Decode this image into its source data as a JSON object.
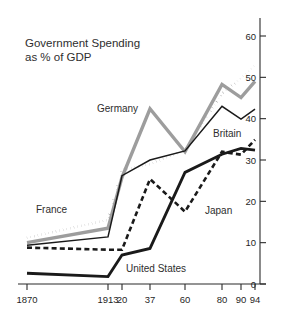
{
  "chart_data": {
    "type": "line",
    "title": "Government Spending\nas % of GDP",
    "title_line1": "Government Spending",
    "title_line2": "as % of GDP",
    "xlabel": "",
    "ylabel": "",
    "x": [
      1870,
      1913,
      1920,
      1937,
      1960,
      1980,
      1990,
      1994
    ],
    "xtick_labels": [
      "1870",
      "1913",
      "20",
      "37",
      "60",
      "80",
      "90",
      "94"
    ],
    "ytick_labels": [
      "0",
      "10",
      "20",
      "30",
      "40",
      "50",
      "60"
    ],
    "yticks": [
      0,
      10,
      20,
      30,
      40,
      50,
      60
    ],
    "ylim": [
      0,
      63
    ],
    "grid": false,
    "legend_position": "inline-annotations",
    "series": [
      {
        "name": "France",
        "values": [
          11.2,
          15.5,
          27.6,
          29.0,
          32.4,
          46.1,
          49.8,
          52.9
        ],
        "color": "#1a1a1a",
        "style": "dotted",
        "width": 2.6,
        "label_x": 36,
        "label_y": 213
      },
      {
        "name": "Germany",
        "values": [
          10.0,
          13.5,
          25.8,
          42.4,
          32.0,
          48.3,
          45.1,
          49.0
        ],
        "color": "#9d9d9d",
        "style": "solid",
        "width": 3.4,
        "label_x": 97,
        "label_y": 112
      },
      {
        "name": "Britain",
        "values": [
          9.4,
          11.4,
          26.2,
          30.0,
          32.2,
          43.0,
          39.9,
          42.3
        ],
        "color": "#1a1a1a",
        "style": "solid",
        "width": 1.5,
        "label_x": 213,
        "label_y": 137
      },
      {
        "name": "Japan",
        "values": [
          8.8,
          8.3,
          8.3,
          25.4,
          17.5,
          32.0,
          31.3,
          34.9
        ],
        "color": "#1a1a1a",
        "style": "dashed",
        "width": 2.6,
        "label_x": 205,
        "label_y": 214
      },
      {
        "name": "United States",
        "values": [
          2.6,
          1.8,
          7.0,
          8.6,
          27.0,
          31.4,
          32.8,
          32.4
        ],
        "color": "#1a1a1a",
        "style": "solid",
        "width": 2.8,
        "label_x": 126,
        "label_y": 272
      }
    ]
  },
  "axis": {
    "x_pixels": [
      27,
      108,
      122,
      150,
      185,
      222,
      241,
      255
    ],
    "y_zero_px": 284,
    "y_sixty_px": 36,
    "right_axis_x": 260,
    "baseline_left": 18,
    "baseline_right": 266
  }
}
